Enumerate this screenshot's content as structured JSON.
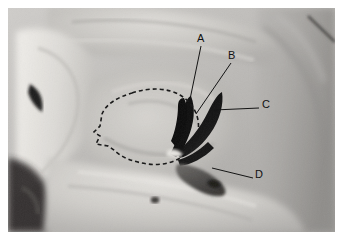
{
  "figure": {
    "kind": "anatomical-photograph",
    "background_color": "#ffffff",
    "photo": {
      "x": 8,
      "y": 8,
      "width": 327,
      "height": 224,
      "base_tone": "#b9b9b9",
      "highlight_tone": "#e2e0dd",
      "midtone": "#a8a6a3",
      "shadow_tone": "#4a4846",
      "black_tone": "#0d0d0d"
    },
    "outline": {
      "style": "dashed",
      "color": "#1a1a1a",
      "dash": "4 3",
      "width": 1.6,
      "description": "dashed outline of orbital floor region"
    },
    "leader_line_color": "#141414",
    "labels": [
      {
        "id": "A",
        "text": "A",
        "label_x": 197,
        "label_y": 33,
        "line_from": [
          201,
          46
        ],
        "line_to": [
          188,
          109
        ]
      },
      {
        "id": "B",
        "text": "B",
        "label_x": 228,
        "label_y": 50,
        "line_from": [
          231,
          63
        ],
        "line_to": [
          196,
          114
        ]
      },
      {
        "id": "C",
        "text": "C",
        "label_x": 262,
        "label_y": 104,
        "line_from": [
          259,
          108
        ],
        "line_to": [
          214,
          110
        ]
      },
      {
        "id": "D",
        "text": "D",
        "label_x": 255,
        "label_y": 174,
        "line_from": [
          253,
          178
        ],
        "line_to": [
          212,
          168
        ]
      }
    ]
  }
}
